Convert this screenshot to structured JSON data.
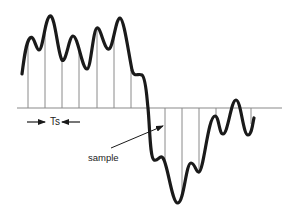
{
  "diagram": {
    "labels": {
      "period": "Ts",
      "sample": "sample"
    },
    "colors": {
      "signal": "#1a1a1a",
      "axis": "#8a8a8a",
      "sample_lines": "#8a8a8a",
      "arrows": "#1a1a1a",
      "background": "#ffffff"
    },
    "axis": {
      "y": 108,
      "x_start": 17,
      "x_end": 282
    },
    "sampling_interval_px": 17.3,
    "sample_x_positions": [
      28,
      45,
      62,
      79,
      97,
      114,
      131,
      148,
      165,
      182,
      199,
      216,
      234,
      251
    ],
    "annotations": [
      {
        "type": "interval-arrows",
        "label": "Ts",
        "between_samples": [
          1,
          2
        ]
      },
      {
        "type": "pointer-arrow",
        "label": "sample",
        "points_to": "signal-curve"
      }
    ]
  }
}
